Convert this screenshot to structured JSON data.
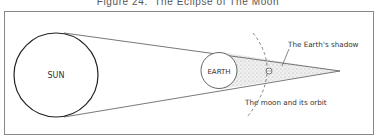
{
  "figure": {
    "title": "Figure 24.  The Eclipse of The Moon"
  },
  "diagram": {
    "sun_label": "SUN",
    "earth_label": "EARTH",
    "shadow_label": "The Earth's shadow",
    "moon_label": "The moon and its orbit"
  },
  "colors": {
    "stroke": "#333333",
    "frame": "#777777",
    "shadow_fill": "#e4e4e4",
    "background": "#ffffff"
  }
}
